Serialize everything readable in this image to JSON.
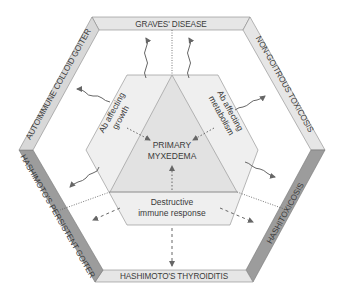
{
  "diagram": {
    "outer_bands": [
      {
        "id": "top",
        "label": "GRAVES' DISEASE",
        "shade": "light"
      },
      {
        "id": "upper-right",
        "label": "NON-GOITROUS TOXICOSIS",
        "shade": "light"
      },
      {
        "id": "lower-right",
        "label": "HASHITOXICOSIS",
        "shade": "dark"
      },
      {
        "id": "bottom",
        "label": "HASHIMOTO'S THYROIDITIS",
        "shade": "light"
      },
      {
        "id": "lower-left",
        "label": "HASHIMOTO'S PERSISTENT GOITER",
        "shade": "dark"
      },
      {
        "id": "upper-left",
        "label": "AUTOIMMUNE COLLOID GOITER",
        "shade": "light"
      }
    ],
    "inner": {
      "left_region": {
        "line1": "Ab affecting",
        "line2": "growth"
      },
      "right_region": {
        "line1": "Ab affecting",
        "line2": "metabolism"
      },
      "bottom_region": {
        "line1": "Destructive",
        "line2": "immune response"
      },
      "center": {
        "line1": "PRIMARY",
        "line2": "MYXEDEMA"
      }
    },
    "colors": {
      "band_light": "#e6e6e6",
      "band_dark": "#9a9a9a",
      "band_edge": "#f4f4f4",
      "inner_fill": "#eeeeee",
      "triangle_fill": "#e4e4e4",
      "line": "#777777",
      "arrow": "#666666"
    }
  }
}
